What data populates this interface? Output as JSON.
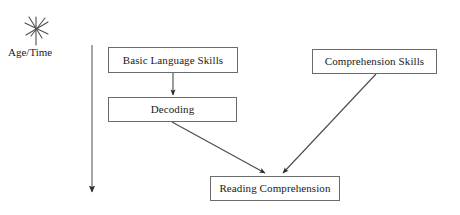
{
  "diagram": {
    "background_color": "#ffffff",
    "line_color": "#555555",
    "box_border_color": "#6b6b6b",
    "text_color": "#1a1a1a",
    "axis": {
      "icon": "starburst-icon",
      "caption": "Age/Time",
      "direction": "downward",
      "arrow_from_y": 45,
      "arrow_to_y": 195,
      "arrow_x": 92
    },
    "nodes": [
      {
        "id": "basic-language-skills",
        "label": "Basic Language Skills",
        "x": 108,
        "y": 47,
        "width": 130,
        "height": 26
      },
      {
        "id": "decoding",
        "label": "Decoding",
        "x": 108,
        "y": 97,
        "width": 129,
        "height": 25
      },
      {
        "id": "comprehension-skills",
        "label": "Comprehension Skills",
        "x": 312,
        "y": 49,
        "width": 125,
        "height": 25
      },
      {
        "id": "reading-comprehension",
        "label": "Reading Comprehension",
        "x": 210,
        "y": 176,
        "width": 130,
        "height": 25
      }
    ],
    "edges": [
      {
        "id": "basic-language-skills-to-decoding",
        "from": "basic-language-skills",
        "to": "decoding",
        "x1": 173,
        "y1": 73,
        "x2": 173,
        "y2": 96
      },
      {
        "id": "decoding-to-reading-comprehension",
        "from": "decoding",
        "to": "reading-comprehension",
        "x1": 172,
        "y1": 122,
        "x2": 266,
        "y2": 175
      },
      {
        "id": "comprehension-skills-to-reading-comprehension",
        "from": "comprehension-skills",
        "to": "reading-comprehension",
        "x1": 376,
        "y1": 74,
        "x2": 282,
        "y2": 175
      }
    ]
  }
}
